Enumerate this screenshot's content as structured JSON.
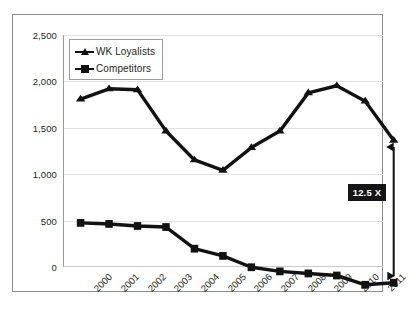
{
  "chart_data": {
    "type": "line",
    "title": "",
    "xlabel": "",
    "ylabel": "",
    "categories": [
      "2000",
      "2001",
      "2002",
      "2003",
      "2004",
      "2005",
      "2006",
      "2007",
      "2008",
      "2009",
      "2010",
      "2011"
    ],
    "series": [
      {
        "name": "WK Loyalists",
        "marker": "triangle",
        "color": "#121212",
        "values": [
          1900,
          2000,
          1990,
          1590,
          1310,
          1210,
          1430,
          1590,
          1960,
          2030,
          1880,
          1500
        ]
      },
      {
        "name": "Competitors",
        "marker": "square",
        "color": "#121212",
        "values": [
          700,
          690,
          670,
          660,
          450,
          380,
          270,
          230,
          210,
          190,
          100,
          120
        ]
      }
    ],
    "ylim": [
      0,
      2500
    ],
    "yticks": [
      0,
      500,
      1000,
      1500,
      2000,
      2500
    ],
    "ytick_labels": [
      "0",
      "500",
      "1,000",
      "1,500",
      "2,000",
      "2,500"
    ],
    "grid": true,
    "legend_position": "top-left",
    "annotations": [
      {
        "name": "ratio-callout",
        "text": "12.5 X",
        "at_category": "2011",
        "from_value": 120,
        "to_value": 1500,
        "style": "double-headed-arrow-with-black-label"
      }
    ]
  },
  "legend": {
    "items": [
      {
        "label": "WK Loyalists",
        "marker": "triangle-marker"
      },
      {
        "label": "Competitors",
        "marker": "square-marker"
      }
    ]
  }
}
